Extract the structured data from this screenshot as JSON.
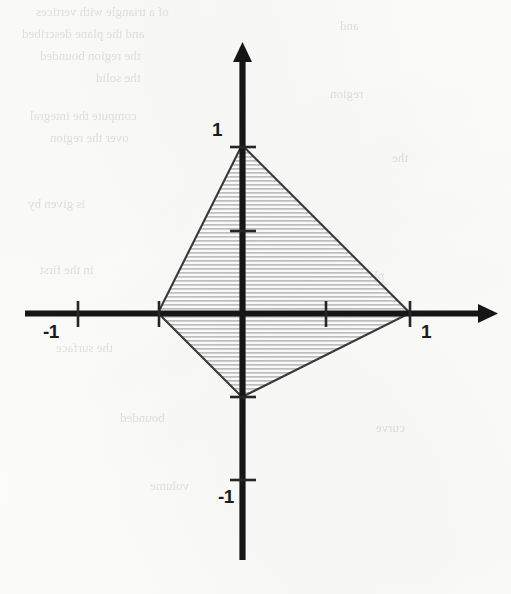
{
  "figure": {
    "kind": "coordinate-plane-diagram",
    "background_color": "#fdfdfc",
    "ink_color": "#1c1c1c",
    "shading_color": "#b9b9b9"
  },
  "axes": {
    "x_axis_name": "x-axis",
    "y_axis_name": "y-axis",
    "origin_px": {
      "x": 242,
      "y": 313
    },
    "unit_px": 168,
    "x_range_px": {
      "start": 25,
      "end": 498
    },
    "y_range_px": {
      "start": 42,
      "end": 560
    }
  },
  "labels": [
    {
      "id": "y-pos-one",
      "text": "1",
      "x": 212,
      "y": 120
    },
    {
      "id": "y-neg-one",
      "text": "-1",
      "x": 218,
      "y": 487
    },
    {
      "id": "x-pos-one",
      "text": "1",
      "x": 421,
      "y": 322
    },
    {
      "id": "x-neg-one",
      "text": "-1",
      "x": 43,
      "y": 322
    }
  ],
  "ticks": {
    "x_axis_values": [
      -1,
      -0.5,
      0.5,
      1
    ],
    "y_axis_values": [
      1,
      0.5,
      -0.5,
      -1
    ],
    "labeled_x": [
      -1,
      1
    ],
    "labeled_y": [
      1,
      -1
    ]
  },
  "chart_data": {
    "type": "scatter",
    "title": "",
    "xlabel": "",
    "ylabel": "",
    "xlim": [
      -1.3,
      1.52
    ],
    "ylim": [
      -1.47,
      1.61
    ],
    "grid": false,
    "legend": null,
    "tick_labels_x": [
      "-1",
      "1"
    ],
    "tick_labels_y": [
      "1",
      "-1"
    ],
    "tick_values_x": [
      -1,
      1
    ],
    "tick_values_y": [
      1,
      -1
    ],
    "annotations": [],
    "series": [
      {
        "name": "shaded-region",
        "kind": "polygon",
        "closed": true,
        "fill": "hatched-horizontal",
        "fill_color": "#b9b9b9",
        "edge_color": "#3a3a3a",
        "vertices": [
          {
            "label": "top",
            "x": 0,
            "y": 1
          },
          {
            "label": "right",
            "x": 1,
            "y": 0
          },
          {
            "label": "bottom",
            "x": 0,
            "y": -0.5
          },
          {
            "label": "left",
            "x": -0.5,
            "y": 0
          }
        ]
      }
    ]
  },
  "ghost_text": [
    {
      "text": "of a triangle with vertices",
      "x": 36,
      "y": 4,
      "size": 13
    },
    {
      "text": "and the plane described",
      "x": 22,
      "y": 26,
      "size": 13
    },
    {
      "text": "the region bounded",
      "x": 40,
      "y": 48,
      "size": 13
    },
    {
      "text": "the solid",
      "x": 96,
      "y": 70,
      "size": 13
    },
    {
      "text": "compute the integral",
      "x": 30,
      "y": 108,
      "size": 13
    },
    {
      "text": "over the region",
      "x": 50,
      "y": 130,
      "size": 13
    },
    {
      "text": "is given by",
      "x": 28,
      "y": 196,
      "size": 13
    },
    {
      "text": "in the first",
      "x": 40,
      "y": 262,
      "size": 13
    },
    {
      "text": "the surface",
      "x": 56,
      "y": 340,
      "size": 13
    },
    {
      "text": "bounded",
      "x": 120,
      "y": 410,
      "size": 13
    },
    {
      "text": "volume",
      "x": 150,
      "y": 478,
      "size": 13
    },
    {
      "text": "and",
      "x": 340,
      "y": 18,
      "size": 13
    },
    {
      "text": "region",
      "x": 330,
      "y": 86,
      "size": 13
    },
    {
      "text": "the",
      "x": 392,
      "y": 150,
      "size": 13
    },
    {
      "text": "plane",
      "x": 356,
      "y": 268,
      "size": 13
    },
    {
      "text": "curve",
      "x": 376,
      "y": 420,
      "size": 13
    }
  ]
}
